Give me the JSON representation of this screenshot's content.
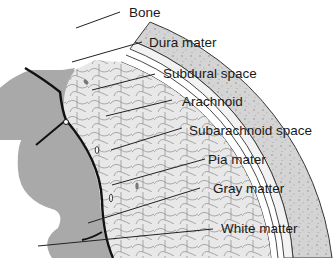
{
  "diagram": {
    "colors": {
      "bone": "#d4d4d4",
      "bone_dots": "#a8a8a8",
      "subarachnoid": "#e6e6e6",
      "brain": "#a9a9a9",
      "outline": "#333333",
      "pia": "#111111",
      "leader": "#222222"
    },
    "labels": [
      {
        "id": "bone",
        "text": "Bone"
      },
      {
        "id": "dura",
        "text": "Dura mater"
      },
      {
        "id": "subdural",
        "text": "Subdural space"
      },
      {
        "id": "arachnoid",
        "text": "Arachnoid"
      },
      {
        "id": "subarachnoid",
        "text": "Subarachnoid space"
      },
      {
        "id": "pia",
        "text": "Pia mater"
      },
      {
        "id": "gray",
        "text": "Gray matter"
      },
      {
        "id": "white",
        "text": "White matter"
      }
    ]
  }
}
